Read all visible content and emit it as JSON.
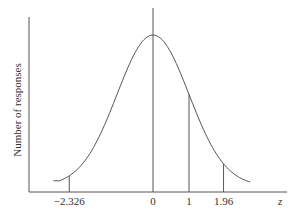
{
  "chart_data": {
    "type": "line",
    "title": "",
    "xlabel": "z",
    "ylabel": "Number of responses",
    "series": [
      {
        "name": "normal distribution",
        "distribution": "standard normal",
        "mean": 0,
        "sd": 1
      }
    ],
    "x_ticks": [
      {
        "value": -2.326,
        "label": "−2.326"
      },
      {
        "value": 0,
        "label": "0"
      },
      {
        "value": 1,
        "label": "1"
      },
      {
        "value": 1.96,
        "label": "1.96"
      }
    ],
    "vertical_markers": [
      -2.326,
      0,
      1,
      1.96
    ],
    "xlim": [
      -2.6,
      2.5
    ],
    "grid": false,
    "legend": "none"
  }
}
